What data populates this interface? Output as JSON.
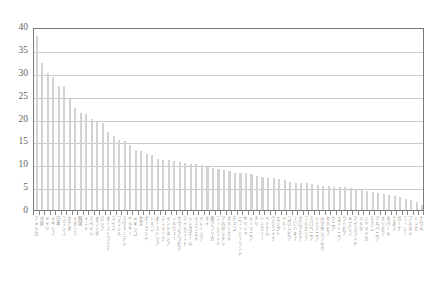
{
  "chart_data": {
    "type": "bar",
    "title": "",
    "subtitle": "",
    "xlabel": "",
    "ylabel": "",
    "ylim": [
      0,
      40
    ],
    "ytick_step": 5,
    "ytick_labels": [
      "40",
      "35",
      "30",
      "25",
      "20",
      "15",
      "10",
      "5",
      "0"
    ],
    "ytick_values": [
      40,
      35,
      30,
      25,
      20,
      15,
      10,
      5,
      0
    ],
    "grid": "horizontal",
    "legend": "none",
    "bar_color": "#d2d2d2",
    "axis_color": "#7a7a7a",
    "gridline_color": "#c9c9c9",
    "sorted": "descending",
    "categories": [
      "アメリカ",
      "中国",
      "ドイツ",
      "イギリス",
      "日本",
      "フランス",
      "カナダ",
      "イタリア",
      "韓国",
      "インド",
      "スペイン",
      "オランダ",
      "ロシア",
      "オーストラリア",
      "スイス",
      "ブラジル",
      "スウェーデン",
      "ベルギー",
      "メキシコ",
      "台湾",
      "ポーランド",
      "トルコ",
      "オーストリア",
      "デンマーク",
      "インドネシア",
      "ノルウェー",
      "サウジアラビア",
      "アイルランド",
      "シンガポール",
      "イスラエル",
      "マレーシア",
      "タイ",
      "南アフリカ",
      "フィンランド",
      "アルゼンチン",
      "ポルトガル",
      "チェコ",
      "ニュージーランド",
      "ギリシャ",
      "ルーマニア",
      "チリ",
      "ハンガリー",
      "ベトナム",
      "ウクライナ",
      "エジプト",
      "ペルー",
      "コロンビア",
      "スロバキア",
      "クロアチア",
      "ブルガリア",
      "スロベニア",
      "リトアニア",
      "ルクセンブルク",
      "セルビア",
      "ケニア",
      "エストニア",
      "ラトビア",
      "キプロス",
      "アイスランド",
      "マルタ",
      "ジャマイカ",
      "モナコ",
      "アルバニア",
      "ボリビア",
      "ネパール",
      "ラオス",
      "ガーナ",
      "フィジー",
      "ブルネイ",
      "トンガ",
      "ナウル"
    ],
    "values": [
      38.0,
      32.2,
      30.0,
      29.0,
      27.2,
      27.0,
      24.2,
      22.2,
      21.2,
      21.0,
      20.0,
      19.2,
      19.0,
      17.0,
      16.2,
      15.2,
      15.0,
      14.2,
      13.2,
      13.0,
      12.2,
      12.0,
      11.2,
      11.0,
      11.0,
      10.8,
      10.5,
      10.2,
      10.0,
      10.0,
      9.8,
      9.5,
      9.2,
      9.0,
      8.8,
      8.5,
      8.2,
      8.0,
      8.0,
      7.8,
      7.5,
      7.2,
      7.0,
      7.0,
      6.8,
      6.5,
      6.2,
      6.0,
      6.0,
      5.8,
      5.6,
      5.4,
      5.2,
      5.2,
      5.0,
      5.0,
      5.0,
      4.8,
      4.6,
      4.4,
      4.2,
      4.0,
      3.8,
      3.5,
      3.2,
      3.0,
      2.8,
      2.5,
      2.2,
      1.8,
      1.2
    ]
  }
}
